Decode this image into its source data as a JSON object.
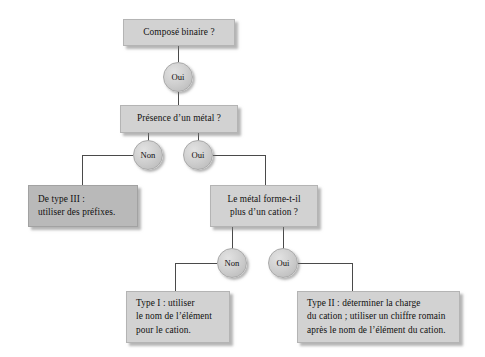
{
  "diagram": {
    "background_color": "#ffffff",
    "box_color": "#d2d2d2",
    "box_color_dark": "#b9b9b9",
    "circle_color": "#cfcfcf",
    "edge_color": "#4a4a4a",
    "nodes": {
      "q_binaire": {
        "type": "decision-box",
        "lines": [
          "Composé binaire ?"
        ]
      },
      "edge_oui_1": {
        "type": "label-circle",
        "label": "Oui"
      },
      "q_metal": {
        "type": "decision-box",
        "lines": [
          "Présence d’un métal ?"
        ]
      },
      "edge_non_1": {
        "type": "label-circle",
        "label": "Non"
      },
      "edge_oui_2": {
        "type": "label-circle",
        "label": "Oui"
      },
      "result_type3": {
        "type": "result-box",
        "lines": [
          "De type III :",
          "utiliser des préfixes."
        ]
      },
      "q_cation": {
        "type": "decision-box",
        "lines": [
          "Le métal forme-t-il",
          "plus d’un cation ?"
        ]
      },
      "edge_non_2": {
        "type": "label-circle",
        "label": "Non"
      },
      "edge_oui_3": {
        "type": "label-circle",
        "label": "Oui"
      },
      "result_type1": {
        "type": "result-box",
        "lines": [
          "Type I : utiliser",
          "le nom de l’élément",
          "pour le cation."
        ]
      },
      "result_type2": {
        "type": "result-box",
        "lines": [
          "Type II : déterminer la charge",
          "du cation ; utiliser un chiffre romain",
          "après le nom de l’élément du cation."
        ]
      }
    }
  }
}
